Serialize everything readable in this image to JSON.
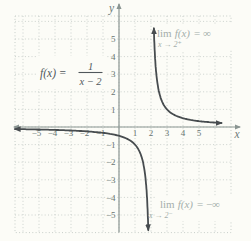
{
  "figure": {
    "formula": {
      "lhs": "f(x) =",
      "numerator": "1",
      "denominator": "x − 2"
    },
    "axes": {
      "x_label": "x",
      "y_label": "y"
    },
    "annotations": {
      "top": {
        "lim": "lim",
        "func": "f(x)",
        "rest": "= ∞",
        "condition": "x → 2⁺"
      },
      "bottom": {
        "lim": "lim",
        "func": "f(x)",
        "rest": "= −∞",
        "condition": "x → 2⁻"
      }
    },
    "colors": {
      "background": "#fcfcf7",
      "grid": "#c7cec9",
      "axis": "#8a9592",
      "curve": "#474c4f",
      "tick_text": "#687572",
      "axis_letter_text": "#6e7b78",
      "formula_text": "#50575b",
      "annotation_text": "#a4afab"
    }
  },
  "chart_data": {
    "type": "line",
    "function": "f(x) = 1/(x−2)",
    "vertical_asymptote_x": 2,
    "horizontal_asymptote_y": 0,
    "xlim": [
      -6.5,
      7
    ],
    "ylim": [
      -6.5,
      6.5
    ],
    "x_ticks": [
      -5,
      -4,
      -3,
      -2,
      -1,
      1,
      2,
      3,
      4,
      5
    ],
    "y_ticks": [
      -5,
      -4,
      -3,
      -2,
      -1,
      1,
      2,
      3,
      4,
      5
    ],
    "grid": true,
    "legend": false,
    "series": [
      {
        "name": "left-branch",
        "domain": [
          -6.5,
          1.83
        ],
        "behavior": "approaches y = 0 from below as x → −∞; y → −∞ as x → 2⁻",
        "sample_points": [
          {
            "x": -5,
            "y": -0.14
          },
          {
            "x": -4,
            "y": -0.17
          },
          {
            "x": -3,
            "y": -0.2
          },
          {
            "x": -2,
            "y": -0.25
          },
          {
            "x": -1,
            "y": -0.33
          },
          {
            "x": 0,
            "y": -0.5
          },
          {
            "x": 1,
            "y": -1
          },
          {
            "x": 1.5,
            "y": -2
          },
          {
            "x": 1.8,
            "y": -5
          }
        ]
      },
      {
        "name": "right-branch",
        "domain": [
          2.18,
          6.4
        ],
        "behavior": "y → ∞ as x → 2⁺; approaches y = 0 from above as x → ∞",
        "sample_points": [
          {
            "x": 2.2,
            "y": 5
          },
          {
            "x": 2.5,
            "y": 2
          },
          {
            "x": 3,
            "y": 1
          },
          {
            "x": 4,
            "y": 0.5
          },
          {
            "x": 5,
            "y": 0.33
          },
          {
            "x": 6,
            "y": 0.25
          }
        ]
      }
    ],
    "annotations": [
      "lim f(x) = ∞ as x → 2⁺",
      "lim f(x) = −∞ as x → 2⁻"
    ]
  }
}
